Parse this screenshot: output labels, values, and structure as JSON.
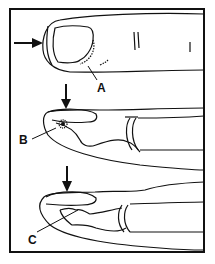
{
  "figure": {
    "labels": {
      "a": "A",
      "b": "B",
      "c": "C"
    },
    "colors": {
      "line": "#111111",
      "background": "#ffffff"
    }
  }
}
